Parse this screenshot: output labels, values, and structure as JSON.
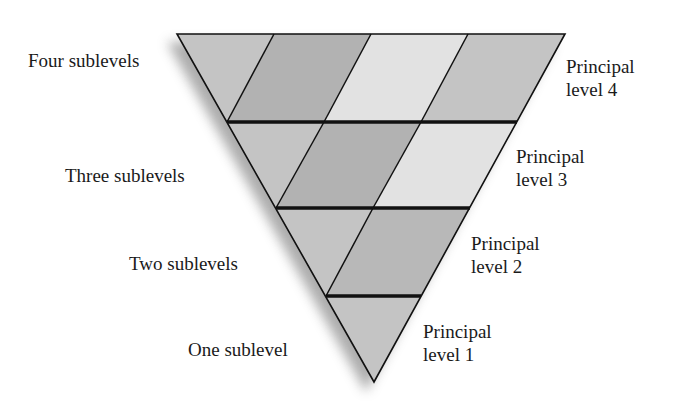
{
  "diagram": {
    "colors": {
      "light": "#e2e2e2",
      "medium": "#c4c4c4",
      "dark": "#b2b2b2",
      "outline": "#111111",
      "shadow": "#8a8a8a"
    },
    "left_labels": [
      {
        "text": "Four sublevels"
      },
      {
        "text": "Three sublevels"
      },
      {
        "text": "Two sublevels"
      },
      {
        "text": "One sublevel"
      }
    ],
    "right_labels": [
      {
        "line1": "Principal",
        "line2": "level 4"
      },
      {
        "line1": "Principal",
        "line2": "level 3"
      },
      {
        "line1": "Principal",
        "line2": "level 2"
      },
      {
        "line1": "Principal",
        "line2": "level 1"
      }
    ],
    "rows": [
      {
        "level": 4,
        "sublevels": 4,
        "shades": [
          "medium",
          "dark",
          "light",
          "medium"
        ]
      },
      {
        "level": 3,
        "sublevels": 3,
        "shades": [
          "medium",
          "dark",
          "light"
        ]
      },
      {
        "level": 2,
        "sublevels": 2,
        "shades": [
          "medium",
          "dark"
        ]
      },
      {
        "level": 1,
        "sublevels": 1,
        "shades": [
          "medium"
        ]
      }
    ]
  }
}
